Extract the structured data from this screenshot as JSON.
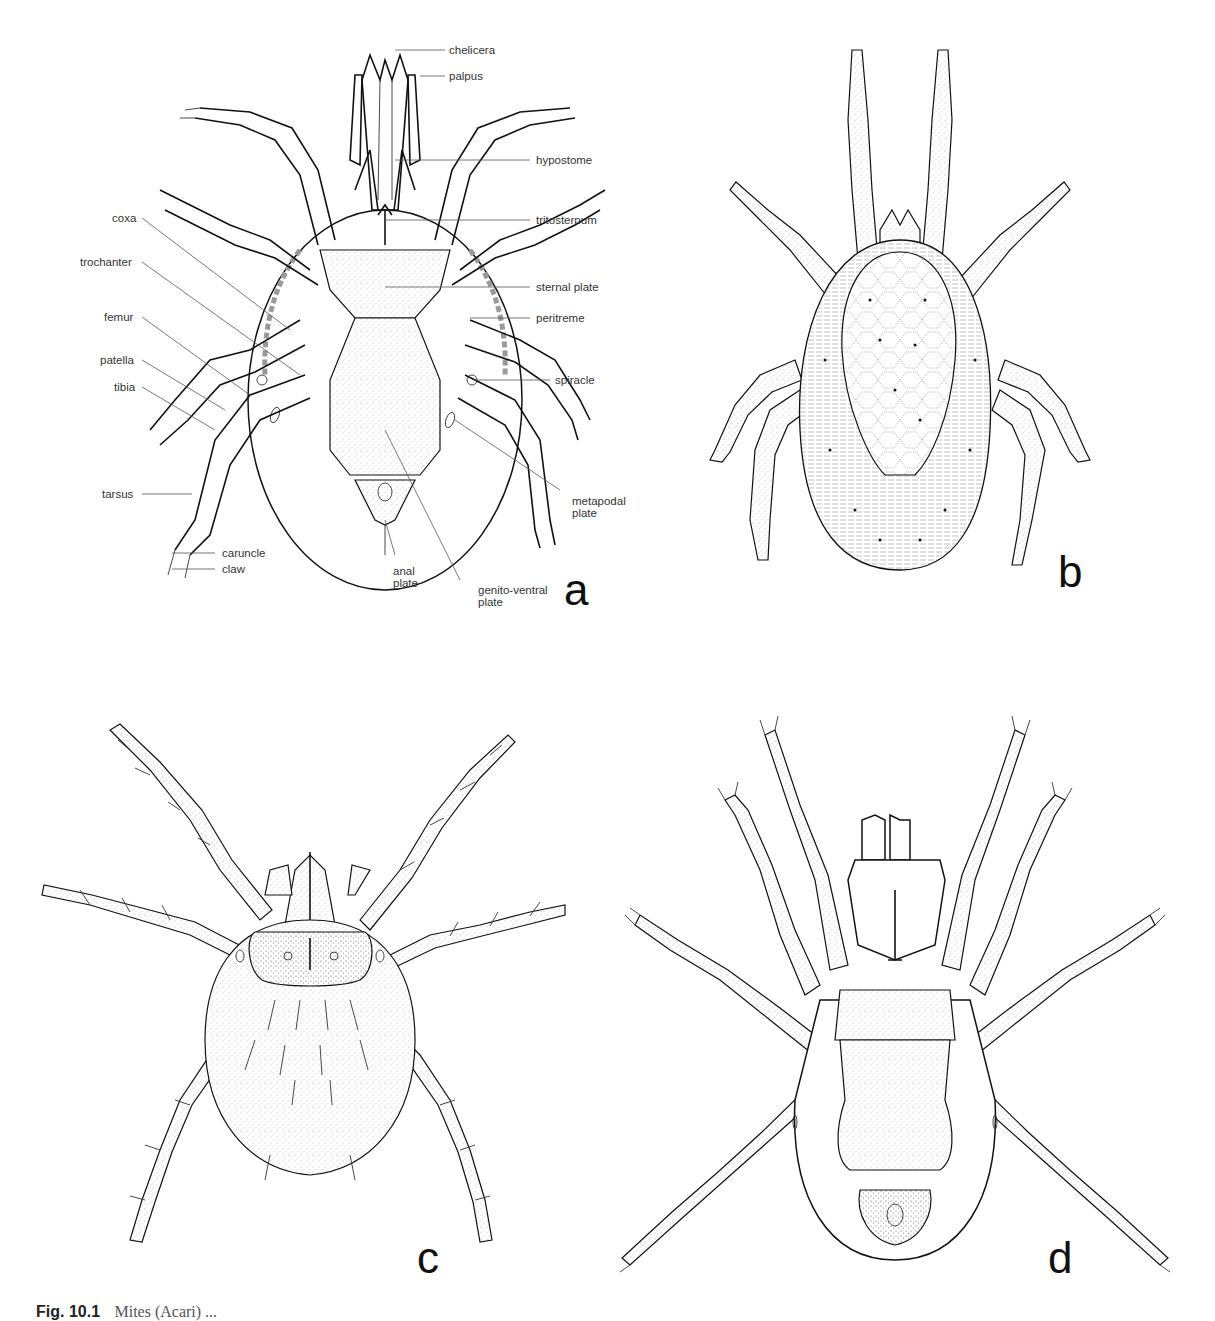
{
  "figure": {
    "panels": [
      {
        "id": "a",
        "letter": "a",
        "view": "ventral, labelled",
        "labels_right": [
          "chelicera",
          "palpus",
          "hypostome",
          "tritosternum",
          "sternal plate",
          "peritreme",
          "spiracle"
        ],
        "labels_left": [
          "coxa",
          "trochanter",
          "femur",
          "patella",
          "tibia",
          "tarsus",
          "caruncle",
          "claw"
        ],
        "labels_bottom": {
          "metapodal_plate": [
            "metapodal",
            "plate"
          ],
          "genito_ventral_plate": [
            "genito-ventral",
            "plate"
          ],
          "anal_plate": [
            "anal",
            "plate"
          ]
        }
      },
      {
        "id": "b",
        "letter": "b",
        "view": "dorsal, reticulate shield"
      },
      {
        "id": "c",
        "letter": "c",
        "view": "dorsal, larva with plumose setae"
      },
      {
        "id": "d",
        "letter": "d",
        "view": "ventral"
      }
    ],
    "caption": {
      "figure_number": "Fig. 10.1",
      "text": "Mites (Acari) ..."
    }
  }
}
